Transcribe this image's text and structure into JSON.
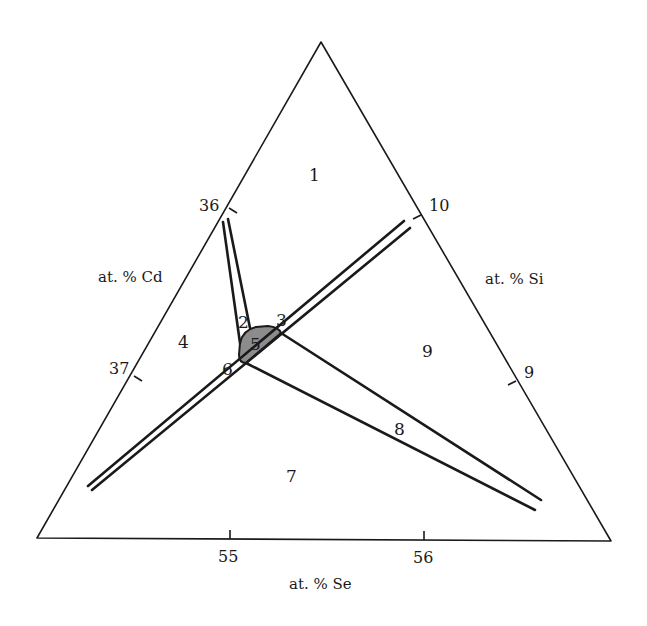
{
  "figure": {
    "type": "ternary-phase-diagram-fragment",
    "colors": {
      "line": "#1a1a1a",
      "shaded_region": "#8c8c8c",
      "background": "#ffffff"
    }
  },
  "axes": {
    "left": {
      "label": "at. % Cd",
      "ticks": [
        "36",
        "37"
      ]
    },
    "right": {
      "label": "at. % Si",
      "ticks": [
        "10",
        "9"
      ]
    },
    "bottom": {
      "label": "at. % Se",
      "ticks": [
        "55",
        "56"
      ]
    }
  },
  "regions": [
    {
      "id": "1",
      "label": "1"
    },
    {
      "id": "2",
      "label": "2"
    },
    {
      "id": "3",
      "label": "3"
    },
    {
      "id": "4",
      "label": "4"
    },
    {
      "id": "5",
      "label": "5",
      "shaded": true
    },
    {
      "id": "6",
      "label": "6"
    },
    {
      "id": "7",
      "label": "7"
    },
    {
      "id": "8",
      "label": "8"
    },
    {
      "id": "9",
      "label": "9"
    }
  ]
}
